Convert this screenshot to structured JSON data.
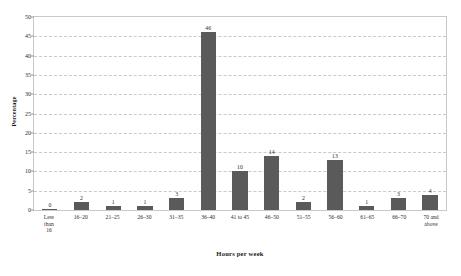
{
  "top_caption": "",
  "chart_data": {
    "type": "bar",
    "title": "",
    "xlabel": "Hours per week",
    "ylabel": "Percentage",
    "ylim": [
      0,
      50
    ],
    "ytick_step": 5,
    "yticks": [
      "0",
      "5",
      "10",
      "15",
      "20",
      "25",
      "30",
      "35",
      "40",
      "45",
      "50"
    ],
    "grid": true,
    "legend": "none",
    "bar_color": "#5a5a5a",
    "categories": [
      "Less\nthan\n16",
      "16–20",
      "21–25",
      "26–30",
      "31–35",
      "36–40",
      "41 to 45",
      "46–50",
      "51–55",
      "56–60",
      "61–65",
      "66–70",
      "70 and\nabove"
    ],
    "values": [
      0,
      2,
      1,
      1,
      3,
      46,
      10,
      14,
      2,
      13,
      1,
      3,
      4
    ],
    "data_labels": [
      "0",
      "2",
      "1",
      "1",
      "3",
      "46",
      "10",
      "14",
      "2",
      "13",
      "1",
      "3",
      "4"
    ]
  }
}
